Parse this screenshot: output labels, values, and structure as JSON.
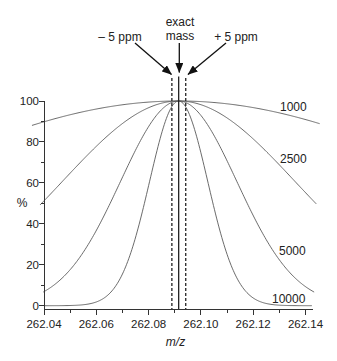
{
  "chart_data": {
    "type": "line",
    "title": "",
    "xlabel": "m/z",
    "ylabel": "%",
    "xlim": [
      262.04,
      262.14
    ],
    "ylim": [
      0,
      100
    ],
    "x_axis_extent": [
      262.04,
      262.1427
    ],
    "y_axis_extent": [
      -2,
      100
    ],
    "grid": false,
    "legend": "none (inline series labels at right)",
    "x_ticks": [
      262.04,
      262.06,
      262.08,
      262.1,
      262.12,
      262.14
    ],
    "x_tick_labels": [
      "262.04",
      "262.06",
      "262.08",
      "262.10",
      "262.12",
      "262.14"
    ],
    "x_minor_ticks": [
      262.05,
      262.07,
      262.09,
      262.11,
      262.13
    ],
    "y_ticks": [
      0,
      20,
      40,
      60,
      80,
      100
    ],
    "y_tick_labels": [
      "0",
      "20",
      "40",
      "60",
      "80",
      "100"
    ],
    "y_minor_ticks": [
      10,
      30,
      50,
      70,
      90
    ],
    "peak_shape": "gaussian, FWHM = m/R",
    "exact_mass": 262.0915,
    "sample_x": [
      262.04,
      262.05,
      262.06,
      262.07,
      262.08,
      262.09,
      262.1,
      262.11,
      262.12,
      262.13,
      262.14
    ],
    "series": [
      {
        "name": "1000",
        "label": "1000",
        "resolution": 1000,
        "x_range": [
          262.0354,
          262.1454
        ],
        "values": [
          89.8,
          93.3,
          96.1,
          98.2,
          99.5,
          100.0,
          99.7,
          98.6,
          96.8,
          94.2,
          90.9
        ]
      },
      {
        "name": "2500",
        "label": "2500",
        "resolution": 2500,
        "x_range": [
          262.0385,
          262.1442
        ],
        "values": [
          51.2,
          64.8,
          77.9,
          89.0,
          96.7,
          99.9,
          98.2,
          91.7,
          81.5,
          68.8,
          55.2
        ]
      },
      {
        "name": "5000",
        "label": "5000",
        "resolution": 5000,
        "x_range": [
          262.0397,
          262.1435
        ],
        "values": [
          6.9,
          17.6,
          36.7,
          62.7,
          87.5,
          99.8,
          93.0,
          70.8,
          44.1,
          22.4,
          9.3
        ]
      },
      {
        "name": "10000",
        "label": "10000",
        "resolution": 10000,
        "x_range": [
          262.04,
          262.1427
        ],
        "values": [
          0.0,
          0.1,
          1.8,
          15.5,
          58.6,
          99.1,
          74.7,
          25.1,
          3.8,
          0.3,
          0.0
        ]
      }
    ],
    "reference_lines": [
      {
        "name": "minus-5-ppm",
        "label": "– 5 ppm",
        "x": 262.0889,
        "style": "dashed"
      },
      {
        "name": "exact-mass",
        "label_line1": "exact",
        "label_line2": "mass",
        "x": 262.0915,
        "style": "solid"
      },
      {
        "name": "plus-5-ppm",
        "label": "+ 5 ppm",
        "x": 262.0942,
        "style": "dashed"
      }
    ]
  }
}
